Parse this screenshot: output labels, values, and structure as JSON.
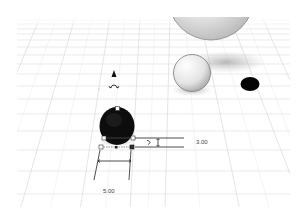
{
  "viewport": {
    "background": "#ffffff",
    "grid_color": "#d9d9d9"
  },
  "selected_shape": {
    "type": "cylinder",
    "color": "#111111",
    "dimensions": {
      "width_label": "5.00",
      "height_label": "3.00"
    }
  },
  "scene_objects": [
    {
      "type": "sphere",
      "size": "large",
      "color": "#e6e6e6"
    },
    {
      "type": "sphere",
      "size": "small",
      "color": "#f0f0f0"
    },
    {
      "type": "hole-disc",
      "color": "#050505"
    }
  ],
  "gizmos": {
    "lift_arrow_icon": "cone-up",
    "rotate_handle_icon": "rotate-arc"
  }
}
